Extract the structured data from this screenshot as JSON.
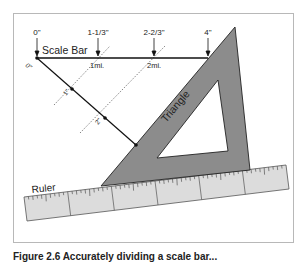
{
  "diagram": {
    "title_label": "Scale Bar",
    "scale_bar": {
      "inch_marks": [
        {
          "label": "0\"",
          "x": 37
        },
        {
          "label": "1-1/3\"",
          "x": 98
        },
        {
          "label": "2-2/3\"",
          "x": 154
        },
        {
          "label": "4\"",
          "x": 208
        }
      ],
      "mile_labels": [
        "1mi.",
        "2mi."
      ]
    },
    "diagonal": {
      "origin_label": "0\"",
      "tick_labels": [
        "1\"",
        "2\""
      ]
    },
    "triangle_label": "Triangle",
    "ruler_label": "Ruler",
    "colors": {
      "triangle_fill": "#8c8c8c",
      "ruler_fill": "#dcdcdc",
      "line": "#111111",
      "frame": "#b8b8b8"
    }
  },
  "caption": "Figure 2.6 Accurately dividing a scale bar..."
}
